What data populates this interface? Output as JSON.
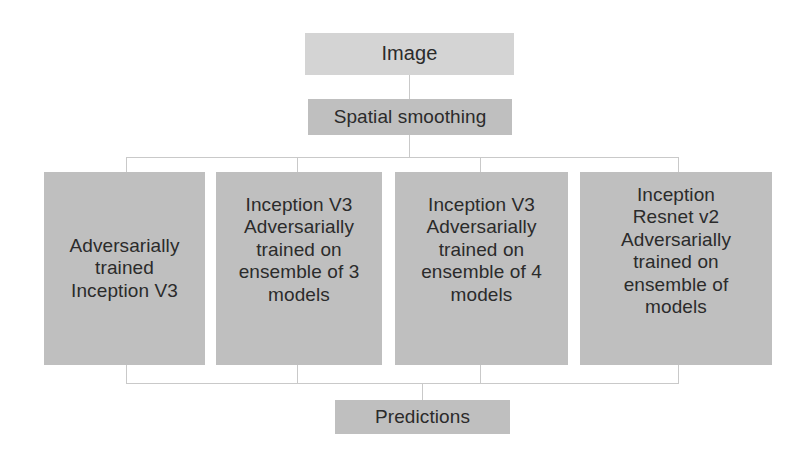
{
  "diagram": {
    "colors": {
      "background": "#ffffff",
      "node_light": "#d4d4d4",
      "node_mid": "#bfbfbf",
      "connector": "#c9c9c9",
      "text": "#2b2b2b"
    },
    "nodes": {
      "image": {
        "label": "Image"
      },
      "spatial_smoothing": {
        "label": "Spatial smoothing"
      },
      "predictions": {
        "label": "Predictions"
      }
    },
    "models": [
      {
        "id": "model-1",
        "label": "Adversarially\ntrained\nInception V3"
      },
      {
        "id": "model-2",
        "label": "Inception V3\nAdversarially\ntrained on\nensemble of 3\nmodels"
      },
      {
        "id": "model-3",
        "label": "Inception V3\nAdversarially\ntrained on\nensemble of 4\nmodels"
      },
      {
        "id": "model-4",
        "label": "Inception\nResnet v2\nAdversarially\ntrained on\nensemble of\nmodels"
      }
    ]
  }
}
